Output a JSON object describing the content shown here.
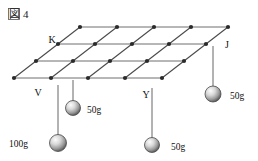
{
  "figure": {
    "caption_mark": "図",
    "caption_number": "4",
    "caption_full": "図 4"
  },
  "grid": {
    "description": "parallelogram mesh drawn in oblique perspective",
    "columns": 5,
    "rows": 4,
    "node_count": 20,
    "line_color": "#6e6e6e",
    "node_color": "#2a2a2a",
    "origin_x": 14,
    "origin_y": 78,
    "col_step_x": 37,
    "row_step_x": 22,
    "row_step_y": -17,
    "node_radius": 2.1
  },
  "point_labels": [
    {
      "id": "K",
      "text": "K",
      "x": 52,
      "y": 43,
      "node_col": 0,
      "node_row": 1
    },
    {
      "id": "J",
      "text": "J",
      "x": 227,
      "y": 48,
      "node_col": 4,
      "node_row": 1
    },
    {
      "id": "V",
      "text": "V",
      "x": 38,
      "y": 96,
      "node_col": 0,
      "node_row": 0
    },
    {
      "id": "Y",
      "text": "Y",
      "x": 146,
      "y": 98,
      "node_col": 2,
      "node_row": 0
    }
  ],
  "weights": [
    {
      "id": "weight-100g-v",
      "label": "100g",
      "mass": "100g",
      "label_x": 28,
      "label_y": 147,
      "label_anchor": "end",
      "string_x": 58,
      "string_top_y": 85,
      "ball_cx": 58,
      "ball_cy": 143,
      "ball_r": 8.5,
      "attached_to": "V"
    },
    {
      "id": "weight-50g-left",
      "label": "50g",
      "mass": "50g",
      "label_x": 87,
      "label_y": 113,
      "label_anchor": "start",
      "string_x": 73,
      "string_top_y": 80,
      "ball_cx": 73,
      "ball_cy": 108,
      "ball_r": 7.5,
      "attached_to": "grid-node"
    },
    {
      "id": "weight-50g-y",
      "label": "50g",
      "mass": "50g",
      "label_x": 171,
      "label_y": 150,
      "label_anchor": "start",
      "string_x": 152,
      "string_top_y": 88,
      "ball_cx": 152,
      "ball_cy": 145,
      "ball_r": 7.5,
      "attached_to": "Y"
    },
    {
      "id": "weight-50g-j",
      "label": "50g",
      "mass": "50g",
      "label_x": 230,
      "label_y": 99,
      "label_anchor": "start",
      "string_x": 213,
      "string_top_y": 46,
      "ball_cx": 213,
      "ball_cy": 94,
      "ball_r": 8.0,
      "attached_to": "J"
    }
  ],
  "colors": {
    "background": "#ffffff",
    "ink": "#1a1a1a",
    "grid_stroke": "#6e6e6e",
    "diagonal_stroke": "#4a4a4a",
    "node_fill": "#2a2a2a",
    "string_stroke": "#555555",
    "ball_light": "#f2f2f2",
    "ball_mid": "#b9b9b9",
    "ball_dark": "#5d5d5d"
  }
}
